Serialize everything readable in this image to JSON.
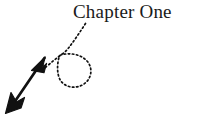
{
  "page": {
    "background_color": "#ffffff",
    "width": 201,
    "height": 119
  },
  "heading": {
    "text": "Chapter One",
    "color": "#1a1a1a",
    "font_size_px": 19,
    "style": "serif"
  },
  "annotation": {
    "kind": "hand-drawn-pointer",
    "description": "Dotted curve descending from the heading, coiling into a loop, then continuing as a solid double-barbed arrow toward the lower-left",
    "stroke_color": "#111111",
    "dotted_segment": {
      "style": "dotted",
      "dash_pattern": "1.6 2.4",
      "stroke_width": 1.6,
      "start_point": [
        84,
        24
      ],
      "end_point": [
        44,
        68
      ]
    },
    "loop": {
      "style": "dotted",
      "center": [
        74,
        68
      ],
      "width_px": 38,
      "height_px": 34,
      "crossing_point": [
        60,
        55
      ]
    },
    "solid_segment": {
      "style": "solid",
      "stroke_width": 2.6,
      "start_point": [
        48,
        66
      ],
      "end_point": [
        14,
        104
      ]
    },
    "arrowheads": [
      {
        "name": "mid-arrowhead",
        "tip": [
          34,
          68
        ],
        "direction": "down-left"
      },
      {
        "name": "tip-arrowhead",
        "tip": [
          6,
          112
        ],
        "direction": "down-left"
      }
    ]
  }
}
